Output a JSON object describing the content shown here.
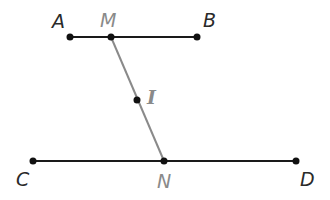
{
  "colors": {
    "line": "#1a1a1a",
    "transversal": "#8a8a8a",
    "point": "#111111",
    "label_dark": "#2a2a2a",
    "label_gray": "#8a8a8a"
  },
  "points": {
    "A": {
      "label": "A",
      "x": 70,
      "y": 37
    },
    "M": {
      "label": "M",
      "x": 111,
      "y": 37
    },
    "B": {
      "label": "B",
      "x": 197,
      "y": 37
    },
    "I": {
      "label": "I",
      "x": 137,
      "y": 100
    },
    "C": {
      "label": "C",
      "x": 33,
      "y": 161
    },
    "N": {
      "label": "N",
      "x": 164,
      "y": 161
    },
    "D": {
      "label": "D",
      "x": 296,
      "y": 161
    }
  },
  "segments": [
    {
      "from": "A",
      "to": "B"
    },
    {
      "from": "C",
      "to": "D"
    },
    {
      "from": "M",
      "to": "N"
    }
  ]
}
